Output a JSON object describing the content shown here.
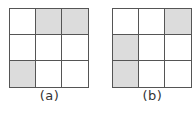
{
  "figures": [
    {
      "id": "a",
      "caption": "(a)",
      "rows": 3,
      "cols": 3,
      "shaded_cells": [
        [
          0,
          1
        ],
        [
          0,
          2
        ],
        [
          2,
          0
        ]
      ],
      "cells": [
        [
          false,
          true,
          true
        ],
        [
          false,
          false,
          false
        ],
        [
          true,
          false,
          false
        ]
      ]
    },
    {
      "id": "b",
      "caption": "(b)",
      "rows": 3,
      "cols": 3,
      "shaded_cells": [
        [
          0,
          2
        ],
        [
          1,
          0
        ],
        [
          2,
          0
        ]
      ],
      "cells": [
        [
          false,
          false,
          true
        ],
        [
          true,
          false,
          false
        ],
        [
          true,
          false,
          false
        ]
      ]
    }
  ],
  "colors": {
    "shaded": "#dcdcdc",
    "unshaded": "#ffffff",
    "grid_line": "#555555",
    "caption_text": "#333333"
  }
}
